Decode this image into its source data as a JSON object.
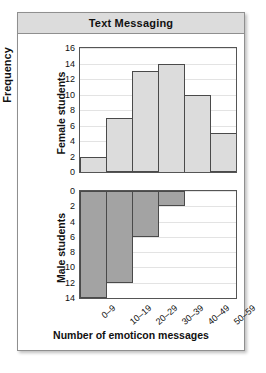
{
  "figure": {
    "title": "Text Messaging",
    "frequency_axis_label": "Frequency",
    "xlabel": "Number of emoticon messages",
    "panels": [
      {
        "name": "Female students"
      },
      {
        "name": "Male students"
      }
    ]
  },
  "colors": {
    "female_bar": "#dcdcdc",
    "male_bar": "#a3a3a3",
    "bar_outline": "#4a4a4a",
    "gridline": "#e3e3e3",
    "banner": "#dcdcdc",
    "frame": "#8f8f8f"
  },
  "chart_data": {
    "type": "bar",
    "title": "Text Messaging",
    "xlabel": "Number of emoticon messages",
    "ylabel": "Frequency",
    "categories": [
      "0–9",
      "10–19",
      "20–29",
      "30–39",
      "40–49",
      "50–59"
    ],
    "series": [
      {
        "name": "Female students",
        "values": [
          2,
          7,
          13,
          14,
          10,
          5
        ],
        "ylim": [
          0,
          16
        ],
        "yticks": [
          0,
          2,
          4,
          6,
          8,
          10,
          12,
          14,
          16
        ],
        "orientation": "up"
      },
      {
        "name": "Male students",
        "values": [
          14,
          12,
          6,
          2,
          0,
          0
        ],
        "ylim": [
          0,
          14
        ],
        "yticks": [
          0,
          2,
          4,
          6,
          8,
          10,
          12,
          14
        ],
        "orientation": "down"
      }
    ],
    "grid": true,
    "legend": "none"
  }
}
